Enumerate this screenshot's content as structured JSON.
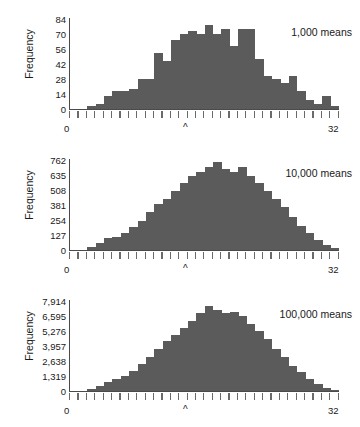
{
  "figure": {
    "axis_label_y": "Frequency",
    "x_axis_min_label": "0",
    "x_axis_max_label": "32",
    "center_marker": "^",
    "bar_color": "#5b5b5b",
    "axis_color": "#4a4a4a",
    "background": "#ffffff"
  },
  "chart_data": [
    {
      "type": "bar",
      "title": "1,000 means",
      "xlabel": "",
      "ylabel": "Frequency",
      "xlim": [
        0,
        32
      ],
      "ylim": [
        0,
        84
      ],
      "grid": false,
      "legend": "none",
      "ytick_labels": [
        "0",
        "14",
        "28",
        "42",
        "56",
        "70",
        "84"
      ],
      "ytick_values": [
        0,
        14,
        28,
        42,
        56,
        70,
        84
      ],
      "xtick_labels": [
        "0",
        "32"
      ],
      "annotations": [
        "^"
      ],
      "bin_width": 1,
      "bin_starts": [
        0,
        1,
        2,
        3,
        4,
        5,
        6,
        7,
        8,
        9,
        10,
        11,
        12,
        13,
        14,
        15,
        16,
        17,
        18,
        19,
        20,
        21,
        22,
        23,
        24,
        25,
        26,
        27,
        28,
        29,
        30,
        31
      ],
      "values": [
        0,
        0,
        2,
        4,
        12,
        16,
        16,
        18,
        28,
        28,
        52,
        44,
        64,
        70,
        72,
        70,
        78,
        70,
        74,
        58,
        74,
        74,
        46,
        30,
        28,
        24,
        30,
        16,
        8,
        4,
        12,
        2
      ]
    },
    {
      "type": "bar",
      "title": "10,000 means",
      "xlabel": "",
      "ylabel": "Frequency",
      "xlim": [
        0,
        32
      ],
      "ylim": [
        0,
        762
      ],
      "grid": false,
      "legend": "none",
      "ytick_labels": [
        "0",
        "127",
        "254",
        "381",
        "508",
        "635",
        "762"
      ],
      "ytick_values": [
        0,
        127,
        254,
        381,
        508,
        635,
        762
      ],
      "xtick_labels": [
        "0",
        "32"
      ],
      "annotations": [
        "^"
      ],
      "bin_width": 1,
      "bin_starts": [
        0,
        1,
        2,
        3,
        4,
        5,
        6,
        7,
        8,
        9,
        10,
        11,
        12,
        13,
        14,
        15,
        16,
        17,
        18,
        19,
        20,
        21,
        22,
        23,
        24,
        25,
        26,
        27,
        28,
        29,
        30,
        31
      ],
      "values": [
        0,
        0,
        20,
        55,
        95,
        110,
        140,
        190,
        240,
        320,
        390,
        430,
        500,
        560,
        620,
        660,
        700,
        740,
        680,
        660,
        700,
        620,
        560,
        500,
        430,
        360,
        280,
        200,
        140,
        80,
        35,
        10
      ]
    },
    {
      "type": "bar",
      "title": "100,000 means",
      "xlabel": "",
      "ylabel": "Frequency",
      "xlim": [
        0,
        32
      ],
      "ylim": [
        0,
        7914
      ],
      "grid": false,
      "legend": "none",
      "ytick_labels": [
        "0",
        "1,319",
        "2,638",
        "3,957",
        "5,276",
        "6,595",
        "7,914"
      ],
      "ytick_values": [
        0,
        1319,
        2638,
        3957,
        5276,
        6595,
        7914
      ],
      "xtick_labels": [
        "0",
        "32"
      ],
      "annotations": [
        "^"
      ],
      "bin_width": 1,
      "bin_starts": [
        0,
        1,
        2,
        3,
        4,
        5,
        6,
        7,
        8,
        9,
        10,
        11,
        12,
        13,
        14,
        15,
        16,
        17,
        18,
        19,
        20,
        21,
        22,
        23,
        24,
        25,
        26,
        27,
        28,
        29,
        30,
        31
      ],
      "values": [
        0,
        0,
        180,
        420,
        720,
        980,
        1250,
        1700,
        2300,
        2950,
        3700,
        4350,
        4900,
        5500,
        6150,
        6800,
        7450,
        7100,
        6800,
        6900,
        6600,
        5900,
        5200,
        4500,
        3700,
        2950,
        2200,
        1600,
        1050,
        600,
        250,
        60
      ]
    }
  ]
}
